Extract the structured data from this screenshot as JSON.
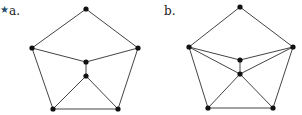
{
  "figures": [
    {
      "id": "a",
      "label": "a.",
      "starred": true,
      "star_glyph": "★",
      "star_color": "#1f4e6b",
      "nodes": [
        {
          "name": "top",
          "x": 86,
          "y": 9
        },
        {
          "name": "left",
          "x": 32,
          "y": 48
        },
        {
          "name": "right",
          "x": 138,
          "y": 48
        },
        {
          "name": "mid-upper",
          "x": 86,
          "y": 62
        },
        {
          "name": "mid-lower",
          "x": 86,
          "y": 76
        },
        {
          "name": "bottom-left",
          "x": 53,
          "y": 109
        },
        {
          "name": "bottom-right",
          "x": 118,
          "y": 109
        }
      ],
      "edges": [
        [
          0,
          1
        ],
        [
          0,
          2
        ],
        [
          1,
          3
        ],
        [
          2,
          3
        ],
        [
          3,
          4
        ],
        [
          4,
          5
        ],
        [
          4,
          6
        ],
        [
          5,
          6
        ],
        [
          1,
          5
        ],
        [
          2,
          6
        ]
      ]
    },
    {
      "id": "b",
      "label": "b.",
      "starred": false,
      "nodes": [
        {
          "name": "top",
          "x": 240,
          "y": 7
        },
        {
          "name": "left",
          "x": 189,
          "y": 47
        },
        {
          "name": "right",
          "x": 293,
          "y": 47
        },
        {
          "name": "mid-upper",
          "x": 240,
          "y": 60
        },
        {
          "name": "mid-lower",
          "x": 240,
          "y": 74
        },
        {
          "name": "bottom-left",
          "x": 208,
          "y": 108
        },
        {
          "name": "bottom-right",
          "x": 273,
          "y": 108
        }
      ],
      "edges": [
        [
          0,
          1
        ],
        [
          0,
          2
        ],
        [
          1,
          3
        ],
        [
          2,
          3
        ],
        [
          1,
          4
        ],
        [
          2,
          4
        ],
        [
          3,
          4
        ],
        [
          4,
          5
        ],
        [
          4,
          6
        ],
        [
          5,
          6
        ],
        [
          1,
          5
        ],
        [
          2,
          6
        ]
      ]
    }
  ],
  "style": {
    "edge_color": "#444444",
    "node_color": "#111111",
    "node_radius": 2.6,
    "edge_width": 1
  }
}
